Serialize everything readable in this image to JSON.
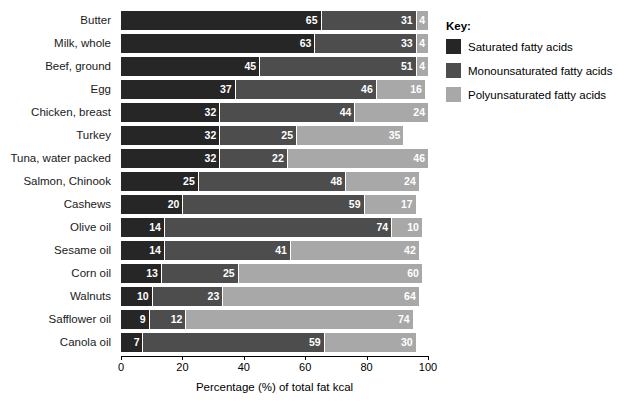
{
  "chart_data": {
    "type": "bar",
    "orientation": "horizontal",
    "stacked": true,
    "title": "",
    "xlabel": "Percentage (%) of total fat kcal",
    "ylabel": "",
    "xlim": [
      0,
      100
    ],
    "xticks": [
      0,
      20,
      40,
      60,
      80,
      100
    ],
    "xtick_labels": [
      "0",
      "20",
      "40",
      "60",
      "80",
      "100"
    ],
    "grid": false,
    "legend_position": "right",
    "categories": [
      "Butter",
      "Milk, whole",
      "Beef, ground",
      "Egg",
      "Chicken, breast",
      "Turkey",
      "Tuna, water packed",
      "Salmon, Chinook",
      "Cashews",
      "Olive oil",
      "Sesame oil",
      "Corn oil",
      "Walnuts",
      "Safflower oil",
      "Canola oil"
    ],
    "series": [
      {
        "name": "Saturated fatty acids",
        "color": "#262626",
        "values": [
          65,
          63,
          45,
          37,
          32,
          32,
          32,
          25,
          20,
          14,
          14,
          13,
          10,
          9,
          7
        ]
      },
      {
        "name": "Monounsaturated fatty acids",
        "color": "#4d4d4d",
        "values": [
          31,
          33,
          51,
          46,
          44,
          25,
          22,
          48,
          59,
          74,
          41,
          25,
          23,
          12,
          59
        ]
      },
      {
        "name": "Polyunsaturated fatty acids",
        "color": "#a8a8a8",
        "values": [
          4,
          4,
          4,
          16,
          24,
          35,
          46,
          24,
          17,
          10,
          42,
          60,
          64,
          74,
          30
        ]
      }
    ]
  },
  "key": {
    "title": "Key:",
    "items": [
      {
        "label": "Saturated fatty acids",
        "color": "#262626"
      },
      {
        "label": "Monounsaturated fatty acids",
        "color": "#4d4d4d"
      },
      {
        "label": "Polyunsaturated fatty acids",
        "color": "#a8a8a8"
      }
    ]
  }
}
